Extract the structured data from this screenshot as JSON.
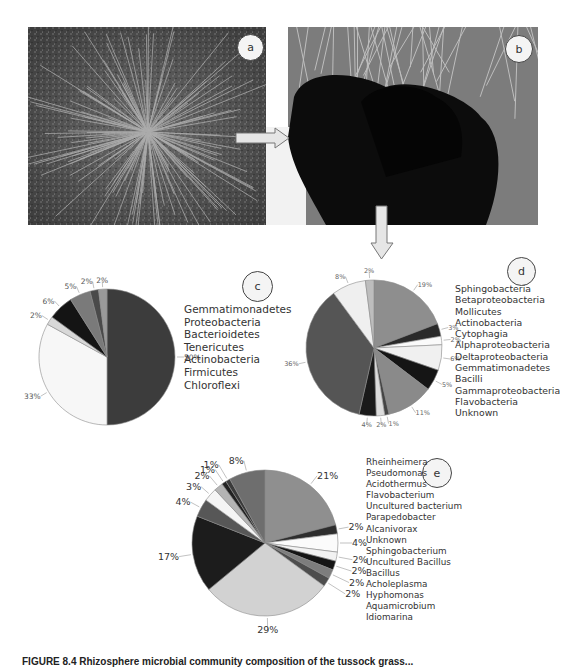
{
  "panels": {
    "a": {
      "label": "a"
    },
    "b": {
      "label": "b"
    },
    "c": {
      "label": "c"
    },
    "d": {
      "label": "d"
    },
    "e": {
      "label": "e"
    }
  },
  "caption": "FIGURE 8.4 Rhizosphere microbial community composition of the tussock grass...",
  "chart_data": [
    {
      "panel": "c",
      "type": "pie",
      "title": "",
      "legend": [
        "Gemmatimonadetes",
        "Proteobacteria",
        "Bacterioidetes",
        "Tenericutes",
        "Actinobacteria",
        "Firmicutes",
        "Chloroflexi"
      ],
      "slices": [
        {
          "value": 50,
          "label": "50%",
          "color": "#3c3c3c"
        },
        {
          "value": 33,
          "label": "33%",
          "color": "#f7f7f7"
        },
        {
          "value": 2,
          "label": "2%",
          "color": "#d8d8d8"
        },
        {
          "value": 6,
          "label": "6%",
          "color": "#141414"
        },
        {
          "value": 5,
          "label": "5%",
          "color": "#7a7a7a"
        },
        {
          "value": 2,
          "label": "2%",
          "color": "#4a4a4a"
        },
        {
          "value": 2,
          "label": "2%",
          "color": "#9a9a9a"
        }
      ],
      "legend_position": "right"
    },
    {
      "panel": "d",
      "type": "pie",
      "title": "",
      "legend": [
        "Sphingobacteria",
        "Betaproteobacteria",
        "Mollicutes",
        "Actinobacteria",
        "Cytophagia",
        "Alphaproteobacteria",
        "Deltaproteobacteria",
        "Gemmatimonadetes",
        "Bacilli",
        "Gammaproteobacteria",
        "Flavobacteria",
        "Unknown"
      ],
      "slices": [
        {
          "value": 19,
          "label": "19%",
          "color": "#8e8e8e"
        },
        {
          "value": 3,
          "label": "3%",
          "color": "#2a2a2a"
        },
        {
          "value": 2,
          "label": "2%",
          "color": "#fafafa"
        },
        {
          "value": 6,
          "label": "6%",
          "color": "#f0f0f0"
        },
        {
          "value": 5,
          "label": "5%",
          "color": "#151515"
        },
        {
          "value": 11,
          "label": "11%",
          "color": "#8a8a8a"
        },
        {
          "value": 1,
          "label": "1%",
          "color": "#444444"
        },
        {
          "value": 2,
          "label": "2%",
          "color": "#dcdcdc"
        },
        {
          "value": 4,
          "label": "4%",
          "color": "#1a1a1a"
        },
        {
          "value": 36,
          "label": "36%",
          "color": "#555555"
        },
        {
          "value": 8,
          "label": "8%",
          "color": "#efefef"
        },
        {
          "value": 2,
          "label": "2%",
          "color": "#bdbdbd"
        }
      ],
      "legend_position": "right"
    },
    {
      "panel": "e",
      "type": "pie",
      "title": "",
      "legend": [
        "Rheinheimera",
        "Pseudomonas",
        "Acidothermus",
        "Flavobacterium",
        "Uncultured bacterium",
        "Parapedobacter",
        "Alcanivorax",
        "Unknown",
        "Sphingobacterium",
        "Uncultured Bacillus",
        "Bacillus",
        "Acholeplasma",
        "Hyphomonas",
        "Aquamicrobium",
        "Idiomarina"
      ],
      "slices": [
        {
          "value": 21,
          "label": "21%",
          "color": "#8f8f8f"
        },
        {
          "value": 2,
          "label": "2%",
          "color": "#2e2e2e"
        },
        {
          "value": 4,
          "label": "4%",
          "color": "#fbfbfb"
        },
        {
          "value": 2,
          "label": "2%",
          "color": "#f2f2f2"
        },
        {
          "value": 2,
          "label": "2%",
          "color": "#151515"
        },
        {
          "value": 2,
          "label": "2%",
          "color": "#7d7d7d"
        },
        {
          "value": 2,
          "label": "2%",
          "color": "#4d4d4d"
        },
        {
          "value": 29,
          "label": "29%",
          "color": "#d2d2d2"
        },
        {
          "value": 17,
          "label": "17%",
          "color": "#1c1c1c"
        },
        {
          "value": 4,
          "label": "4%",
          "color": "#575757"
        },
        {
          "value": 3,
          "label": "3%",
          "color": "#f5f5f5"
        },
        {
          "value": 2,
          "label": "2%",
          "color": "#b4b4b4"
        },
        {
          "value": 1,
          "label": "1%",
          "color": "#222222"
        },
        {
          "value": 1,
          "label": "1%",
          "color": "#3a3a3a"
        },
        {
          "value": 8,
          "label": "8%",
          "color": "#6e6e6e"
        }
      ],
      "legend_position": "right"
    }
  ]
}
